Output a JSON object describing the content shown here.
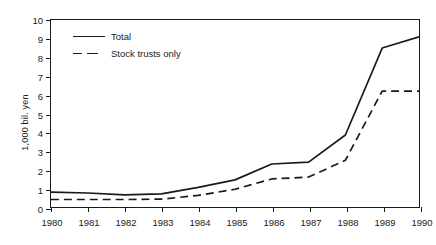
{
  "chart_data": {
    "type": "line",
    "title": "",
    "xlabel": "",
    "ylabel": "1,000 bil. yen",
    "x": [
      1980,
      1981,
      1982,
      1983,
      1984,
      1985,
      1986,
      1987,
      1988,
      1989,
      1990
    ],
    "xtick_labels": [
      "1980",
      "1981",
      "1982",
      "1983",
      "1984",
      "1985",
      "1986",
      "1987",
      "1988",
      "1989",
      "1990"
    ],
    "ytick_labels": [
      "0",
      "1",
      "2",
      "3",
      "4",
      "5",
      "6",
      "7",
      "8",
      "9",
      "10"
    ],
    "ylim": [
      0,
      10
    ],
    "xlim": [
      1980,
      1990
    ],
    "grid": false,
    "legend_position": "top-left",
    "series": [
      {
        "name": "Total",
        "style": "solid",
        "color": "#1a1a1a",
        "values": [
          0.8,
          0.75,
          0.65,
          0.7,
          1.05,
          1.45,
          2.3,
          2.4,
          3.85,
          8.5,
          9.1
        ]
      },
      {
        "name": "Stock trusts only",
        "style": "dashed",
        "color": "#1a1a1a",
        "values": [
          0.4,
          0.4,
          0.4,
          0.42,
          0.62,
          0.95,
          1.5,
          1.6,
          2.5,
          6.2,
          6.2
        ]
      }
    ]
  },
  "legend": {
    "items": [
      {
        "label": "Total",
        "style": "solid"
      },
      {
        "label": "Stock trusts only",
        "style": "dashed"
      }
    ]
  }
}
